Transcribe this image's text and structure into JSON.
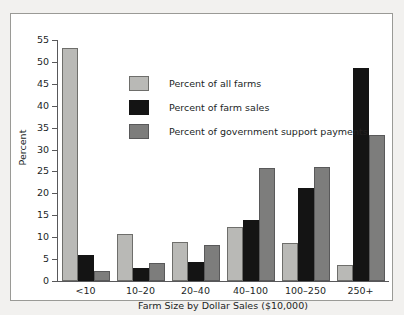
{
  "chart_data": {
    "type": "bar",
    "title": "",
    "subtitle": "",
    "xlabel": "Farm Size by Dollar Sales ($10,000)",
    "ylabel": "Percent",
    "ylim": [
      0,
      55
    ],
    "yticks": [
      0,
      5,
      10,
      15,
      20,
      25,
      30,
      35,
      40,
      45,
      50,
      55
    ],
    "grid": false,
    "legend_position": "upper-center-left",
    "categories": [
      "<10",
      "10–20",
      "20–40",
      "40–100",
      "100–250",
      "250+"
    ],
    "series": [
      {
        "name": "Percent of all farms",
        "color": "#b9b9b6",
        "values": [
          53.1,
          10.8,
          8.9,
          12.3,
          8.7,
          3.6
        ]
      },
      {
        "name": "Percent of farm sales",
        "color": "#141414",
        "values": [
          5.9,
          2.9,
          4.4,
          14.0,
          21.2,
          48.7
        ]
      },
      {
        "name": "Percent of government support payments",
        "color": "#7d7d7c",
        "values": [
          2.2,
          4.2,
          8.2,
          25.8,
          26.0,
          33.3
        ]
      }
    ]
  },
  "figure": {
    "background_color": "#ffffff",
    "page_background_color": "#f2f1ef",
    "frame_color": "#9a9a96",
    "axis_color": "#58585a",
    "text_color": "#221f1f"
  }
}
